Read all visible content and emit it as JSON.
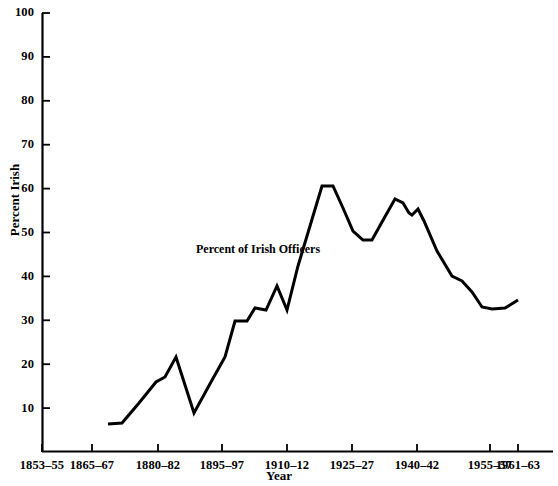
{
  "chart_data": {
    "type": "line",
    "title": "",
    "xlabel": "Year",
    "ylabel": "Percent Irish",
    "ylim": [
      0,
      100
    ],
    "ytick_values": [
      10,
      20,
      30,
      40,
      50,
      60,
      70,
      80,
      90,
      100
    ],
    "ytick_labels": [
      "10",
      "20",
      "30",
      "40",
      "50",
      "60",
      "70",
      "80",
      "90",
      "100"
    ],
    "grid": false,
    "legend_position": "inline-annotation",
    "annotations": [
      {
        "text": "Percent of Irish Officers",
        "x": 1905,
        "y": 46
      }
    ],
    "xtick_labels": [
      "1853–55",
      "1865–67",
      "1880–82",
      "1895–97",
      "1910–12",
      "1925–27",
      "1940–42",
      "1955–57",
      "1961–63"
    ],
    "xtick_px": [
      42,
      92,
      158,
      222,
      287,
      352,
      417,
      490,
      518
    ],
    "series": [
      {
        "name": "Percent of Irish Officers",
        "color": "#000000",
        "x": [
          "1868–70",
          "1871–73",
          "1874–76",
          "1877–79",
          "1880–82",
          "1883–85",
          "1886–88",
          "1889–91",
          "1892–94",
          "1895–97",
          "1898–1900",
          "1901–03",
          "1904–06",
          "1907–09",
          "1910–12",
          "1913–15",
          "1916–18",
          "1919–21",
          "1922–24",
          "1925–27",
          "1928–30",
          "1931–33",
          "1934–36",
          "1937–39",
          "1940–42",
          "1943–45",
          "1946–48",
          "1949–51",
          "1952–54",
          "1955–57",
          "1958–60",
          "1961–63"
        ],
        "values": [
          6,
          6.3,
          11,
          15.5,
          16.5,
          21,
          8,
          15,
          21,
          31,
          31,
          34,
          33.5,
          39.5,
          33.5,
          45,
          54,
          60,
          60,
          55,
          49.5,
          53,
          57.5,
          56.5,
          44.5,
          54,
          52,
          47.5,
          41,
          39,
          32.5,
          33.5
        ]
      }
    ],
    "polyline_px": "108,424 122,423 139,403 156,382 165,377 176,357 194,413 211,382 225,357 235,332 247,332 255,321 266,322 277,296 287,321 298,269 310,230 322,185 331,185 342,207 353,240 362,240 372,242 382,219 395,198 403,202 409,391 409,391",
    "series_points_px": [
      [
        108,
        424
      ],
      [
        122,
        423
      ],
      [
        139,
        403
      ],
      [
        156,
        382
      ],
      [
        165,
        377
      ],
      [
        176,
        357
      ],
      [
        194,
        413
      ],
      [
        211,
        382
      ],
      [
        225,
        357
      ],
      [
        235,
        321
      ],
      [
        247,
        321
      ],
      [
        255,
        308
      ],
      [
        266,
        310
      ],
      [
        277,
        286
      ],
      [
        287,
        310
      ],
      [
        298,
        266
      ],
      [
        310,
        226
      ],
      [
        322,
        186
      ],
      [
        333,
        186
      ],
      [
        343,
        208
      ],
      [
        353,
        231
      ],
      [
        363,
        240
      ],
      [
        372,
        240
      ],
      [
        382,
        222
      ],
      [
        395,
        199
      ],
      [
        403,
        203
      ],
      [
        409,
        213
      ],
      [
        412,
        215
      ],
      [
        418,
        209
      ],
      [
        424,
        221
      ],
      [
        437,
        251
      ],
      [
        452,
        276
      ],
      [
        462,
        281
      ],
      [
        472,
        292
      ],
      [
        482,
        307
      ],
      [
        492,
        309
      ],
      [
        505,
        308
      ],
      [
        518,
        300
      ]
    ]
  },
  "axes": {
    "x_axis_title": "Year",
    "y_axis_title": "Percent Irish"
  }
}
